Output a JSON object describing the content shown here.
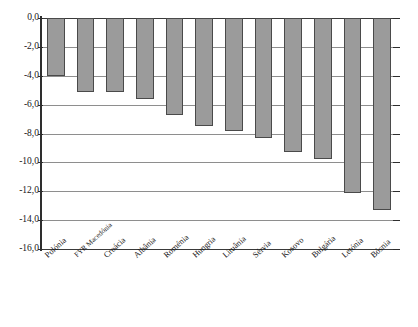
{
  "chart": {
    "title": "",
    "type": "bar"
  },
  "chart_data": {
    "type": "bar",
    "title": "",
    "subtitle": "",
    "xlabel": "",
    "ylabel": "",
    "orientation": "vertical",
    "grid": true,
    "legend": false,
    "decimal_separator": ",",
    "ylim": [
      -16.0,
      0.0
    ],
    "yticks": [
      0.0,
      -2.0,
      -4.0,
      -6.0,
      -8.0,
      -10.0,
      -12.0,
      -14.0,
      -16.0
    ],
    "ytick_labels": [
      "0,0",
      "-2,0",
      "-4,0",
      "-6,0",
      "-8,0",
      "-10,0",
      "-12,0",
      "-14,0",
      "-16,0"
    ],
    "categories": [
      "Polónia",
      "FYR Macedónia",
      "Croácia",
      "Albânia",
      "Roménia",
      "Hungria",
      "Lituânia",
      "Sérvia",
      "Kosovo",
      "Bulgária",
      "Letónia",
      "Bósnia"
    ],
    "values": [
      -4.0,
      -5.1,
      -5.15,
      -5.6,
      -6.7,
      -7.5,
      -7.8,
      -8.3,
      -9.3,
      -9.8,
      -12.1,
      -13.3
    ],
    "series": [
      {
        "name": "",
        "values": [
          -4.0,
          -5.1,
          -5.15,
          -5.6,
          -6.7,
          -7.5,
          -7.8,
          -8.3,
          -9.3,
          -9.8,
          -12.1,
          -13.3
        ]
      }
    ],
    "colors": {
      "bar_fill": "#9b9b9b",
      "bar_stroke": "#4a4a4a",
      "gridline": "#8e8e8e",
      "axis": "#2e2e2e",
      "text": "#161616",
      "background": "#ffffff"
    }
  }
}
